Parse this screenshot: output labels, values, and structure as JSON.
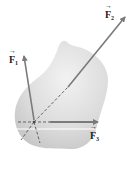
{
  "diagram": {
    "colors": {
      "body": "#d9d9d9",
      "arrow": "#7a7a7a",
      "dashed": "#555555",
      "label": "#222222"
    },
    "forces": [
      {
        "id": "F1",
        "symbol": "F",
        "subscript": "1"
      },
      {
        "id": "F2",
        "symbol": "F",
        "subscript": "2"
      },
      {
        "id": "F3",
        "symbol": "F",
        "subscript": "3"
      }
    ]
  }
}
